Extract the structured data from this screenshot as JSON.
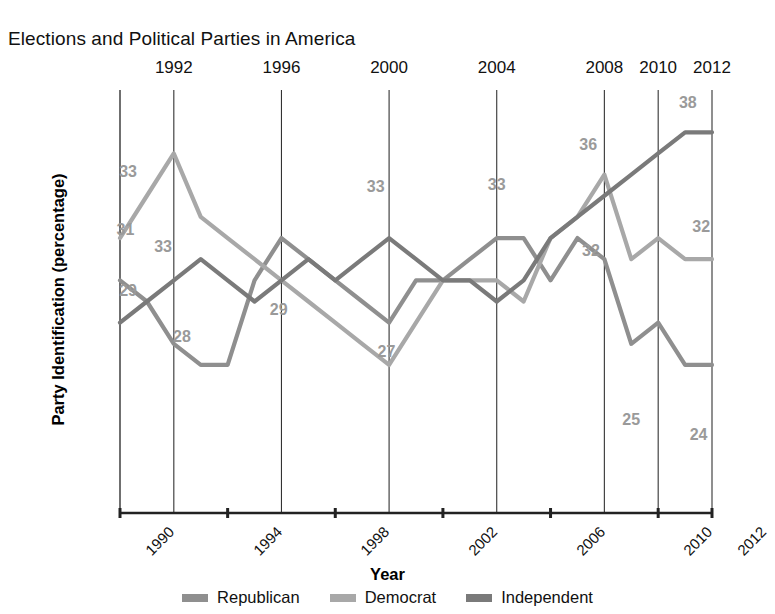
{
  "chart_data": {
    "type": "line",
    "title": "Elections and Political Parties in America",
    "xlabel": "Year",
    "ylabel": "Party Identification (percentage)",
    "xlim": [
      1990,
      2012
    ],
    "ylim": [
      20,
      40
    ],
    "grid": "vertical",
    "legend_position": "bottom",
    "x": [
      1990,
      1991,
      1992,
      1993,
      1994,
      1995,
      1996,
      1997,
      1998,
      1999,
      2000,
      2001,
      2002,
      2003,
      2004,
      2005,
      2006,
      2007,
      2008,
      2009,
      2010,
      2011,
      2012
    ],
    "top_tick_labels": [
      "1992",
      "1996",
      "2000",
      "2004",
      "2008",
      "2010",
      "2012"
    ],
    "top_tick_values": [
      1992,
      1996,
      2000,
      2004,
      2008,
      2010,
      2012
    ],
    "bottom_tick_labels": [
      "1990",
      "1994",
      "1998",
      "2002",
      "2006",
      "2010",
      "2012"
    ],
    "bottom_tick_values": [
      1990,
      1994,
      1998,
      2002,
      2006,
      2010,
      2012
    ],
    "series": [
      {
        "name": "Republican",
        "color": "#8f8f8f",
        "values": [
          31,
          30,
          28,
          27,
          27,
          31,
          33,
          32,
          31,
          30,
          29,
          31,
          31,
          32,
          33,
          33,
          31,
          33,
          32,
          28,
          29,
          27,
          27
        ]
      },
      {
        "name": "Democrat",
        "color": "#a8a8a8",
        "values": [
          33,
          35,
          37,
          34,
          33,
          32,
          31,
          30,
          29,
          28,
          27,
          29,
          31,
          31,
          31,
          30,
          33,
          34,
          36,
          32,
          33,
          32,
          32
        ]
      },
      {
        "name": "Independent",
        "color": "#7a7a7a",
        "values": [
          29,
          30,
          31,
          32,
          31,
          30,
          31,
          32,
          31,
          32,
          33,
          32,
          31,
          31,
          30,
          31,
          33,
          34,
          35,
          36,
          37,
          38,
          38
        ]
      }
    ],
    "point_labels": [
      {
        "text": "33",
        "x": 1990.3,
        "y": 36.1
      },
      {
        "text": "31",
        "x": 1990.2,
        "y": 33.4
      },
      {
        "text": "29",
        "x": 1990.3,
        "y": 30.5
      },
      {
        "text": "33",
        "x": 1991.6,
        "y": 32.6
      },
      {
        "text": "28",
        "x": 1992.3,
        "y": 28.3
      },
      {
        "text": "29",
        "x": 1995.9,
        "y": 29.6
      },
      {
        "text": "33",
        "x": 1999.5,
        "y": 35.4
      },
      {
        "text": "27",
        "x": 1999.9,
        "y": 27.6
      },
      {
        "text": "33",
        "x": 2004.0,
        "y": 35.5
      },
      {
        "text": "36",
        "x": 2007.4,
        "y": 37.4
      },
      {
        "text": "32",
        "x": 2007.5,
        "y": 32.4
      },
      {
        "text": "38",
        "x": 2011.1,
        "y": 39.4
      },
      {
        "text": "32",
        "x": 2011.6,
        "y": 33.5
      },
      {
        "text": "25",
        "x": 2009.0,
        "y": 24.4
      },
      {
        "text": "24",
        "x": 2011.5,
        "y": 23.7
      }
    ],
    "legend": [
      {
        "label": "Republican",
        "color": "#8f8f8f"
      },
      {
        "label": "Democrat",
        "color": "#a8a8a8"
      },
      {
        "label": "Independent",
        "color": "#7a7a7a"
      }
    ]
  }
}
